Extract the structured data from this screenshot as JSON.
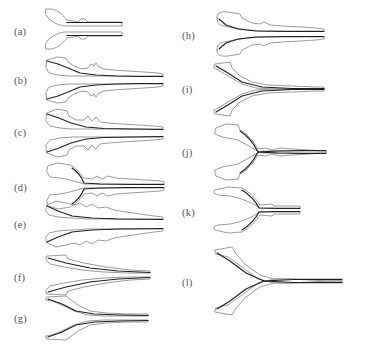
{
  "figure": {
    "type": "multi-panel-shape-figure",
    "panel_count": 12,
    "columns": 2,
    "background_color": "#ffffff",
    "outline_color": "#8a8a8a",
    "spine_color": "#20201f",
    "label_color": "#565656"
  },
  "panels": [
    {
      "id": "a",
      "label": "(a)",
      "column": "left",
      "x": 44,
      "y": 6,
      "w": 82,
      "h": 46,
      "label_x": 14,
      "label_y": 27,
      "style": "short-forked-pair",
      "upper_outline": "M 2,3 L 7,3 C 14,4 19,9 23,14 L 34,16 L 37,13 L 41,13 L 44,16 L 78,16 L 78,20 L 22,20 C 16,20 10,17 5,13 L 2,9 Z",
      "upper_spine": "M 23,16.5 L 78,16.5",
      "lower_outline": "M 2,43 L 7,43 C 14,42 19,37 23,32 L 34,30 L 37,33 L 41,33 L 44,30 L 78,30 L 78,26 L 22,26 C 16,26 10,29 5,33 L 2,37 Z",
      "lower_spine": "M 23,29.5 L 78,29.5"
    },
    {
      "id": "b",
      "label": "(b)",
      "column": "left",
      "x": 44,
      "y": 55,
      "w": 122,
      "h": 50,
      "label_x": 14,
      "label_y": 76,
      "style": "bulged-tweezer-pair",
      "upper_outline": "M 3,5 L 13,2 L 22,3 L 24,7 L 30,11 L 38,14 L 44,13 L 47,9 L 50,11 L 52,8 L 55,12 L 60,14 L 70,15 L 84,16 L 100,17 L 114,18 L 119,19 L 119,21 L 108,21 L 90,21 L 70,21 L 50,21 L 36,21 L 24,21 L 14,20 L 5,18 L 2,13 Z",
      "upper_spine": "M 3,6 L 14,9 L 24,13 L 36,18 L 52,20 L 72,21 L 95,21.5 L 119,21.5",
      "lower_outline": "M 3,45 L 13,48 L 22,47 L 24,43 L 30,39 L 38,36 L 44,37 L 47,41 L 50,39 L 52,42 L 55,38 L 60,36 L 70,35 L 84,34 L 100,33 L 114,32 L 119,31 L 119,29 L 108,29 L 90,29 L 70,29 L 50,29 L 36,29 L 24,29 L 14,30 L 5,32 L 2,37 Z",
      "lower_spine": "M 3,44 L 14,41 L 24,37 L 36,32 L 52,30 L 72,29 L 95,28.5 L 119,28.5"
    },
    {
      "id": "c",
      "label": "(c)",
      "column": "left",
      "x": 44,
      "y": 107,
      "w": 122,
      "h": 52,
      "label_x": 14,
      "label_y": 128,
      "style": "bulged-tweezer-pair",
      "upper_outline": "M 3,6 L 13,2 L 23,4 L 25,9 L 32,13 L 40,13 L 44,9 L 48,14 L 52,10 L 56,15 L 64,16 L 78,17 L 94,18 L 110,19 L 119,20 L 119,22 L 100,22 L 80,22 L 60,22 L 42,22 L 28,22 L 16,21 L 6,19 L 2,14 Z",
      "upper_spine": "M 3,7 L 15,11 L 27,16 L 42,20 L 60,21.5 L 88,22 L 119,22.5",
      "lower_outline": "M 3,46 L 13,50 L 23,48 L 25,43 L 32,39 L 40,39 L 44,43 L 48,38 L 52,42 L 56,37 L 64,36 L 78,35 L 94,34 L 110,33 L 119,32 L 119,30 L 100,30 L 80,30 L 60,30 L 42,30 L 28,30 L 16,31 L 6,33 L 2,38 Z",
      "lower_spine": "M 3,45 L 15,41 L 27,36 L 42,32 L 60,30.5 L 88,30 L 119,29.5"
    },
    {
      "id": "d",
      "label": "(d)",
      "column": "left",
      "x": 44,
      "y": 162,
      "w": 122,
      "h": 48,
      "label_x": 14,
      "label_y": 183,
      "style": "notched-fork-pair",
      "upper_outline": "M 4,4 L 14,1 L 26,3 C 32,6 36,11 40,16 L 48,17 L 53,14 L 58,17 L 64,14 L 72,16 L 86,17 L 102,18 L 116,19 L 120,20 L 120,22 L 100,22 L 78,22 L 56,22 L 40,22 C 32,20 24,17 16,16 L 6,15 L 3,10 Z",
      "upper_spine": "M 28,6 C 34,10 38,16 40,21 L 56,22 L 86,22.5 L 120,22.5",
      "lower_outline": "M 4,44 L 14,47 L 26,45 C 32,42 36,37 40,32 L 48,31 L 53,34 L 58,31 L 64,34 L 72,32 L 86,31 L 102,30 L 116,29 L 120,28 L 120,26 L 100,26 L 78,26 L 56,26 L 40,26 C 32,28 24,31 16,32 L 6,33 L 3,38 Z",
      "lower_spine": "M 28,42 C 34,38 38,32 40,27 L 56,26 L 86,25.5 L 120,25.5"
    },
    {
      "id": "e",
      "label": "(e)",
      "column": "left",
      "x": 44,
      "y": 199,
      "w": 122,
      "h": 50,
      "label_x": 14,
      "label_y": 220,
      "style": "wavy-tweezer-pair",
      "upper_outline": "M 3,6 L 12,2 L 22,4 L 30,6 L 36,4 L 42,8 L 48,5 L 54,9 L 62,8 L 70,11 L 82,13 L 96,15 L 110,17 L 119,18 L 119,20 L 102,20 L 82,20 L 62,20 L 44,20 L 28,19 L 14,18 L 5,16 L 2,12 Z",
      "upper_spine": "M 3,7 L 14,12 L 28,17 L 48,19 L 74,20 L 119,20.5",
      "lower_outline": "M 3,44 L 12,48 L 22,46 L 30,44 L 36,46 L 42,42 L 48,45 L 54,41 L 62,42 L 70,39 L 82,37 L 96,35 L 110,33 L 119,32 L 119,30 L 102,30 L 82,30 L 62,30 L 44,30 L 28,31 L 14,32 L 5,34 L 2,38 Z",
      "lower_spine": "M 3,43 L 14,38 L 28,33 L 48,31 L 74,30 L 119,29.5"
    },
    {
      "id": "f",
      "label": "(f)",
      "column": "left",
      "x": 44,
      "y": 252,
      "w": 112,
      "h": 46,
      "label_x": 14,
      "label_y": 273,
      "style": "smooth-taper-pair",
      "upper_outline": "M 3,4 L 22,3 L 24,7 L 40,11 L 62,15 L 86,18 L 106,19 L 106,21 L 84,21 L 60,20 L 38,18 L 20,15 L 6,12 L 2,8 Z",
      "upper_spine": "M 4,6 L 22,11 L 46,16 L 74,19 L 106,20.5",
      "lower_outline": "M 3,42 L 22,43 L 24,39 L 40,35 L 62,31 L 86,28 L 106,27 L 106,25 L 84,25 L 60,26 L 38,28 L 20,31 L 6,34 L 2,38 Z",
      "lower_spine": "M 4,40 L 22,35 L 46,30 L 74,27 L 106,25.5"
    },
    {
      "id": "g",
      "label": "(g)",
      "column": "left",
      "x": 44,
      "y": 293,
      "w": 112,
      "h": 50,
      "label_x": 14,
      "label_y": 314,
      "style": "stepped-taper-pair",
      "upper_outline": "M 3,4 L 22,3 L 26,6 L 34,12 L 46,18 L 62,20 L 84,21 L 104,21 L 104,23 L 82,23 L 60,23 L 44,22 L 30,18 L 18,12 L 8,8 L 2,7 Z",
      "upper_spine": "M 4,6 L 18,11 L 32,18 L 50,21 L 76,22 L 104,22.5",
      "lower_outline": "M 3,46 L 22,47 L 26,44 L 34,38 L 46,32 L 62,30 L 84,29 L 104,29 L 104,27 L 82,27 L 60,27 L 44,28 L 30,32 L 18,38 L 8,42 L 2,43 Z",
      "lower_spine": "M 4,44 L 18,39 L 32,32 L 50,29 L 76,28 L 104,27.5"
    },
    {
      "id": "h",
      "label": "(h)",
      "column": "right",
      "x": 212,
      "y": 10,
      "w": 118,
      "h": 48,
      "label_x": 182,
      "label_y": 31,
      "style": "hooked-end-pair",
      "upper_outline": "M 5,8 C 4,3 10,1 16,2 L 28,4 L 30,8 L 40,13 L 48,14 L 52,12 L 58,15 L 70,16 L 88,17 L 104,18 L 112,19 L 112,21 L 94,21 L 72,21 L 52,21 L 36,20 L 22,18 L 12,16 C 6,15 5,12 5,8 Z",
      "upper_spine": "M 7,9 L 14,15 L 26,19 L 44,21 L 74,21.5 L 112,21.5",
      "lower_outline": "M 5,40 C 4,45 10,47 16,46 L 28,44 L 30,40 L 40,35 L 48,34 L 52,36 L 58,33 L 70,32 L 88,31 L 104,30 L 112,29 L 112,27 L 94,27 L 72,27 L 52,27 L 36,28 L 22,30 L 12,32 C 6,33 5,36 5,40 Z",
      "lower_spine": "M 7,39 L 14,33 L 26,29 L 44,27 L 74,26.5 L 112,26.5"
    },
    {
      "id": "i",
      "label": "(i)",
      "column": "right",
      "x": 212,
      "y": 60,
      "w": 118,
      "h": 58,
      "label_x": 182,
      "label_y": 85,
      "style": "smooth-kink-pair",
      "upper_outline": "M 3,4 L 18,2 L 20,8 L 28,16 L 40,22 L 56,25 L 80,26 L 104,27 L 112,27 L 112,29 L 88,29 L 62,29 L 44,28 L 30,24 L 16,16 L 6,10 L 2,8 Z",
      "upper_spine": "M 4,6 L 16,13 L 30,22 L 50,27 L 80,28.5 L 112,28.5",
      "lower_outline": "M 3,54 L 18,56 L 20,50 L 28,42 L 40,36 L 56,33 L 80,32 L 104,31 L 112,31 L 112,29 L 88,29 L 62,29 L 44,30 L 30,34 L 16,42 L 6,48 L 2,50 Z",
      "lower_spine": "M 4,52 L 16,45 L 30,36 L 50,31 L 80,29.5 L 112,29.5"
    },
    {
      "id": "j",
      "label": "(j)",
      "column": "right",
      "x": 212,
      "y": 122,
      "w": 118,
      "h": 60,
      "label_x": 182,
      "label_y": 148,
      "style": "wide-notch-fork-pair",
      "upper_outline": "M 4,6 L 14,2 L 26,3 L 28,8 C 36,12 42,20 46,27 L 54,26 L 60,28 L 68,26 L 80,27 L 96,28 L 110,29 L 114,29 L 114,31 L 94,31 L 70,31 L 50,31 C 42,28 34,22 26,18 L 10,15 L 3,12 Z",
      "upper_spine": "M 28,9 C 36,14 42,22 46,30 L 66,31 L 92,31.5 L 114,31.5",
      "lower_outline": "M 4,54 L 14,58 L 26,57 L 28,52 C 36,48 42,40 46,33 L 54,34 L 60,32 L 68,34 L 80,33 L 96,32 L 110,31 L 114,31 L 114,29 L 94,29 L 70,29 L 50,29 C 42,32 34,38 26,42 L 10,45 L 3,48 Z",
      "lower_spine": "M 28,51 C 36,46 42,38 46,30 L 66,29 L 92,28.5 L 114,28.5"
    },
    {
      "id": "k",
      "label": "(k)",
      "column": "right",
      "x": 212,
      "y": 185,
      "w": 100,
      "h": 50,
      "label_x": 182,
      "label_y": 208,
      "style": "deep-notch-fork-pair",
      "upper_outline": "M 3,5 L 16,2 L 30,3 C 38,7 44,14 48,20 L 60,19 L 62,21 L 78,21 L 88,21 L 88,23 L 66,23 L 48,23 C 40,18 30,13 18,11 L 6,10 L 2,8 Z",
      "upper_spine": "M 30,5 C 38,10 44,17 47,23 L 66,23.5 L 88,23.5",
      "lower_outline": "M 3,45 L 16,48 L 30,47 C 38,43 44,36 48,30 L 60,31 L 62,29 L 78,29 L 88,29 L 88,27 L 66,27 L 48,27 C 40,32 30,37 18,39 L 6,40 L 2,42 Z",
      "lower_spine": "M 30,45 C 38,40 44,33 47,27 L 66,26.5 L 88,26.5"
    },
    {
      "id": "l",
      "label": "(l)",
      "column": "right",
      "x": 212,
      "y": 245,
      "w": 135,
      "h": 72,
      "label_x": 182,
      "label_y": 278,
      "style": "long-stepped-taper-pair",
      "upper_outline": "M 3,5 L 20,2 L 24,9 L 34,20 L 48,30 L 62,34 L 78,34 L 98,35 L 118,36 L 130,36 L 130,38 L 106,38 L 82,38 L 62,38 L 46,34 L 30,22 L 16,12 L 4,9 Z",
      "upper_spine": "M 5,8 L 18,16 L 34,28 L 52,36 L 82,37.5 L 130,37.5",
      "lower_outline": "M 3,67 L 20,70 L 24,63 L 34,52 L 48,42 L 62,38 L 78,38 L 98,37 L 118,36 L 130,36 L 130,34 L 106,34 L 82,34 L 62,34 L 46,38 L 30,50 L 16,60 L 4,63 Z",
      "lower_spine": "M 5,64 L 18,56 L 34,44 L 52,36 L 82,34.5 L 130,34.5"
    }
  ]
}
